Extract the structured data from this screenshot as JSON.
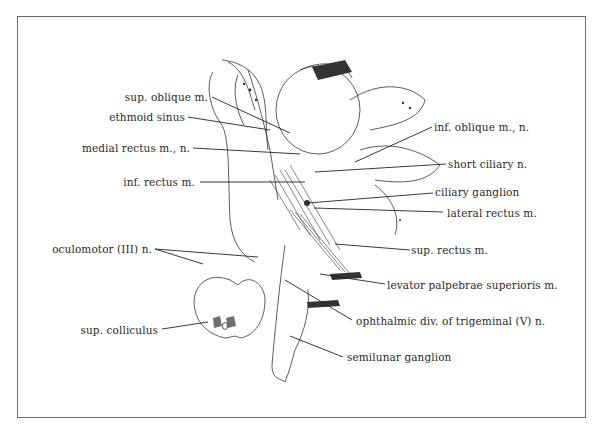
{
  "figure": {
    "type": "anatomical illustration",
    "border_color": "#6a6a6a",
    "line_color": "#222222"
  },
  "labels_left": [
    {
      "id": "sup-oblique",
      "text": "sup. oblique m."
    },
    {
      "id": "ethmoid-sinus",
      "text": "ethmoid sinus"
    },
    {
      "id": "medial-rectus",
      "text": "medial rectus m., n."
    },
    {
      "id": "inf-rectus",
      "text": "inf. rectus m."
    },
    {
      "id": "oculomotor",
      "text": "oculomotor (III) n."
    },
    {
      "id": "sup-colliculus",
      "text": "sup. colliculus"
    }
  ],
  "labels_right": [
    {
      "id": "inf-oblique",
      "text": "inf. oblique m., n."
    },
    {
      "id": "short-ciliary",
      "text": "short ciliary n."
    },
    {
      "id": "ciliary-ganglion",
      "text": "ciliary ganglion"
    },
    {
      "id": "lateral-rectus",
      "text": "lateral rectus m."
    },
    {
      "id": "sup-rectus",
      "text": "sup. rectus m."
    },
    {
      "id": "levator",
      "text": "levator palpebrae superioris m."
    },
    {
      "id": "ophthalmic-div",
      "text": "ophthalmic div. of trigeminal (V) n."
    },
    {
      "id": "semilunar",
      "text": "semilunar ganglion"
    }
  ]
}
